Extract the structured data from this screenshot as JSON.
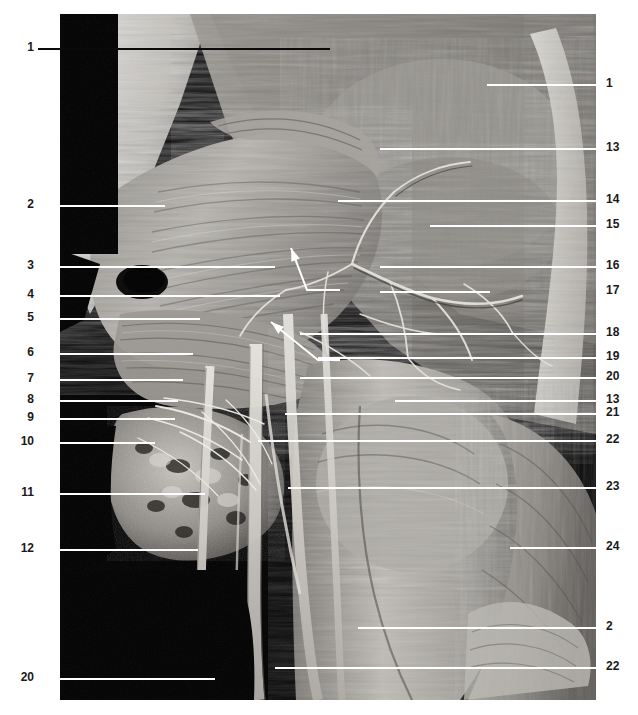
{
  "figure": {
    "type": "anatomical-dissection-photograph",
    "color_mode": "grayscale",
    "background_color": "#ffffff",
    "photo_frame_color": "#000000",
    "leader_line_color": "#ffffff",
    "label_text_color": "#1a1a1a"
  },
  "labels_left": [
    {
      "id": "L1",
      "text": "1",
      "y": 48,
      "line_x1": 38,
      "line_x2": 330,
      "line_color": "dark"
    },
    {
      "id": "L2",
      "text": "2",
      "y": 205,
      "line_x1": 38,
      "line_x2": 165,
      "line_color": "white"
    },
    {
      "id": "L3",
      "text": "3",
      "y": 266,
      "line_x1": 38,
      "line_x2": 275,
      "line_color": "white"
    },
    {
      "id": "L4",
      "text": "4",
      "y": 295,
      "line_x1": 38,
      "line_x2": 280,
      "line_color": "white"
    },
    {
      "id": "L5",
      "text": "5",
      "y": 318,
      "line_x1": 38,
      "line_x2": 200,
      "line_color": "white"
    },
    {
      "id": "L6",
      "text": "6",
      "y": 353,
      "line_x1": 38,
      "line_x2": 193,
      "line_color": "white"
    },
    {
      "id": "L7",
      "text": "7",
      "y": 379,
      "line_x1": 38,
      "line_x2": 183,
      "line_color": "white"
    },
    {
      "id": "L8",
      "text": "8",
      "y": 400,
      "line_x1": 38,
      "line_x2": 178,
      "line_color": "white"
    },
    {
      "id": "L9",
      "text": "9",
      "y": 418,
      "line_x1": 38,
      "line_x2": 175,
      "line_color": "white"
    },
    {
      "id": "L10",
      "text": "10",
      "y": 442,
      "line_x1": 38,
      "line_x2": 155,
      "line_color": "white"
    },
    {
      "id": "L11",
      "text": "11",
      "y": 493,
      "line_x1": 38,
      "line_x2": 205,
      "line_color": "white"
    },
    {
      "id": "L12",
      "text": "12",
      "y": 549,
      "line_x1": 38,
      "line_x2": 198,
      "line_color": "white"
    },
    {
      "id": "L20",
      "text": "20",
      "y": 678,
      "line_x1": 38,
      "line_x2": 215,
      "line_color": "white"
    }
  ],
  "labels_right": [
    {
      "id": "R1",
      "text": "1",
      "y": 84,
      "line_x1": 487,
      "line_x2": 598,
      "line_color": "white"
    },
    {
      "id": "R13",
      "text": "13",
      "y": 148,
      "line_x1": 380,
      "line_x2": 598,
      "line_color": "white"
    },
    {
      "id": "R14",
      "text": "14",
      "y": 200,
      "line_x1": 338,
      "line_x2": 598,
      "line_color": "white"
    },
    {
      "id": "R15",
      "text": "15",
      "y": 225,
      "line_x1": 430,
      "line_x2": 598,
      "line_color": "white"
    },
    {
      "id": "R16",
      "text": "16",
      "y": 266,
      "line_x1": 380,
      "line_x2": 598,
      "line_color": "white"
    },
    {
      "id": "R17",
      "text": "17",
      "y": 291,
      "line_x1": 380,
      "line_x2": 490,
      "line_color": "white"
    },
    {
      "id": "R18",
      "text": "18",
      "y": 333,
      "line_x1": 300,
      "line_x2": 598,
      "line_color": "white"
    },
    {
      "id": "R19",
      "text": "19",
      "y": 357,
      "line_x1": 318,
      "line_x2": 598,
      "line_color": "white"
    },
    {
      "id": "R20",
      "text": "20",
      "y": 377,
      "line_x1": 300,
      "line_x2": 598,
      "line_color": "white"
    },
    {
      "id": "R13b",
      "text": "13",
      "y": 400,
      "line_x1": 395,
      "line_x2": 598,
      "line_color": "white"
    },
    {
      "id": "R21",
      "text": "21",
      "y": 413,
      "line_x1": 285,
      "line_x2": 598,
      "line_color": "white"
    },
    {
      "id": "R22",
      "text": "22",
      "y": 440,
      "line_x1": 258,
      "line_x2": 598,
      "line_color": "white"
    },
    {
      "id": "R23",
      "text": "23",
      "y": 487,
      "line_x1": 288,
      "line_x2": 598,
      "line_color": "white"
    },
    {
      "id": "R24",
      "text": "24",
      "y": 547,
      "line_x1": 510,
      "line_x2": 598,
      "line_color": "white"
    },
    {
      "id": "R2",
      "text": "2",
      "y": 627,
      "line_x1": 358,
      "line_x2": 598,
      "line_color": "white"
    },
    {
      "id": "R22b",
      "text": "22",
      "y": 667,
      "line_x1": 275,
      "line_x2": 598,
      "line_color": "white"
    }
  ],
  "arrow_leaders": [
    {
      "id": "A1",
      "tip_x": 291,
      "tip_y": 248,
      "elbow_x": 307,
      "elbow_y": 290,
      "tail_x": 340,
      "tail_y": 290
    },
    {
      "id": "A2",
      "tip_x": 271,
      "tip_y": 322,
      "elbow_x": 318,
      "elbow_y": 360,
      "tail_x": 340,
      "tail_y": 360
    }
  ],
  "photo": {
    "left": 60,
    "top": 14,
    "width": 536,
    "height": 686,
    "description": "Grayscale dissection of axilla and upper limb showing layered musculature, branching nerves and vessels against black background"
  }
}
